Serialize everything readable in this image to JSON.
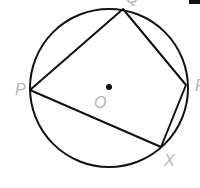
{
  "diagram": {
    "type": "circle-inscribed-quadrilateral",
    "center_label": "O",
    "vertices": [
      {
        "label": "Q",
        "x": 123,
        "y": 9
      },
      {
        "label": "R",
        "x": 186,
        "y": 85
      },
      {
        "label": "X",
        "x": 161,
        "y": 147
      },
      {
        "label": "P",
        "x": 30,
        "y": 90
      }
    ],
    "labels": {
      "P": "P",
      "O": "O",
      "X": "X",
      "Q": "Q",
      "R": "R"
    },
    "colors": {
      "stroke": "#111111",
      "label": "#b5b5b5"
    }
  }
}
